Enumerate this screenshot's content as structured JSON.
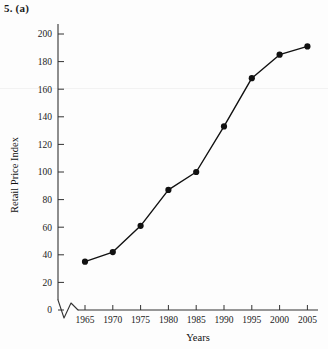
{
  "figure": {
    "label": "5. (a)"
  },
  "chart_data": {
    "type": "line",
    "title": "5. (a)",
    "xlabel": "Years",
    "ylabel": "Retail Price Index",
    "x": [
      1965,
      1970,
      1975,
      1980,
      1985,
      1990,
      1995,
      2000,
      2005
    ],
    "values": [
      35,
      42,
      61,
      87,
      100,
      133,
      168,
      185,
      191
    ],
    "xtick_labels": [
      "1965",
      "1970",
      "1975",
      "1980",
      "1985",
      "1990",
      "1995",
      "2000",
      "2005"
    ],
    "ytick_labels": [
      "0",
      "20",
      "40",
      "60",
      "80",
      "100",
      "120",
      "140",
      "160",
      "180",
      "200"
    ],
    "yticks": [
      0,
      20,
      40,
      60,
      80,
      100,
      120,
      140,
      160,
      180,
      200
    ],
    "xlim": [
      1962.5,
      2007.5
    ],
    "ylim": [
      0,
      210
    ],
    "grid": false,
    "legend": null,
    "marker": "filled-circle",
    "line_color": "#111111",
    "marker_color": "#111111",
    "axis_break": "y-axis zigzag break near origin",
    "background_color": "#fdfdfd"
  }
}
